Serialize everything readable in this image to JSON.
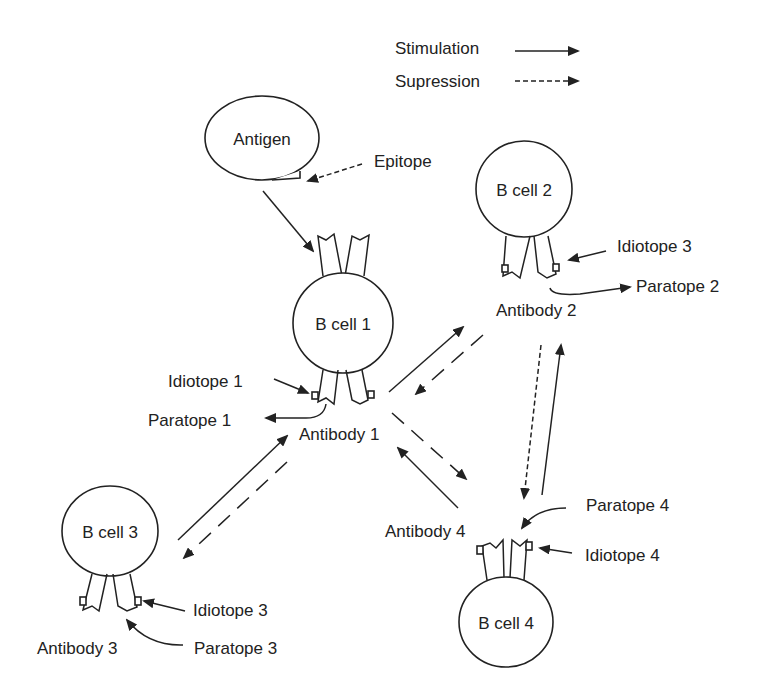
{
  "legend": {
    "stimulation": "Stimulation",
    "suppression": "Supression"
  },
  "nodes": {
    "antigen": "Antigen",
    "epitope": "Epitope",
    "bcell1": "B cell 1",
    "bcell2": "B cell 2",
    "bcell3": "B cell 3",
    "bcell4": "B cell 4"
  },
  "labels": {
    "idiotope1": "Idiotope 1",
    "paratope1": "Paratope 1",
    "antibody1": "Antibody 1",
    "idiotope2": "Idiotope 3",
    "paratope2": "Paratope 2",
    "antibody2": "Antibody 2",
    "idiotope3": "Idiotope 3",
    "paratope3": "Paratope 3",
    "antibody3": "Antibody 3",
    "paratope4": "Paratope 4",
    "idiotope4": "Idiotope 4",
    "antibody4": "Antibody 4"
  },
  "colors": {
    "stroke": "#222222",
    "background": "#ffffff"
  }
}
